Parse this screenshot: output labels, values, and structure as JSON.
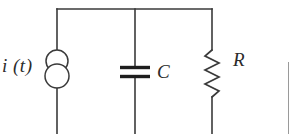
{
  "figure": {
    "type": "circuit-diagram",
    "width": 291,
    "height": 134,
    "background_color": "#ffffff",
    "line_color": "#3a3a3a",
    "label_color": "#2b2b2b",
    "line_width": 1.6
  },
  "labels": {
    "source": "i (t)",
    "capacitor": "C",
    "resistor": "R"
  },
  "components": [
    {
      "id": "current-source",
      "kind": "current-source",
      "label": "i (t)",
      "symbol": "two-overlapping-circles",
      "branch": "left",
      "x": 57,
      "y_top": 50,
      "y_bottom": 88
    },
    {
      "id": "capacitor",
      "kind": "capacitor",
      "label": "C",
      "symbol": "two-parallel-plates",
      "branch": "middle",
      "x": 135,
      "y_top": 67,
      "y_bottom": 77
    },
    {
      "id": "resistor",
      "kind": "resistor",
      "label": "R",
      "symbol": "zigzag",
      "branch": "right",
      "x": 212,
      "y_top": 50,
      "y_bottom": 97
    }
  ],
  "wires": {
    "top_rail": {
      "x_start": 57,
      "x_end": 212,
      "y": 9
    },
    "branch_x": {
      "left": 57,
      "middle": 135,
      "right": 212
    },
    "bottom_y": 134,
    "junctions": [
      {
        "x": 57,
        "y": 9
      },
      {
        "x": 135,
        "y": 9
      },
      {
        "x": 212,
        "y": 9
      }
    ]
  },
  "artifacts": {
    "right_edge_line": {
      "x": 288,
      "y_top": 62,
      "y_bottom": 134,
      "color": "#9a9a9a"
    }
  }
}
